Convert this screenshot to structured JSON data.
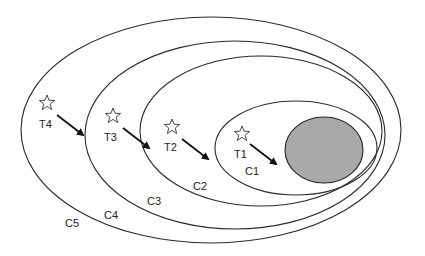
{
  "diagram": {
    "type": "nested-ellipses",
    "core": {
      "name": "core",
      "color": "#a9a9a9",
      "cx": 324,
      "cy": 150,
      "rx": 39,
      "ry": 33
    },
    "rings": [
      {
        "id": "ring-1",
        "cx": 296,
        "cy": 148,
        "rx": 81,
        "ry": 47
      },
      {
        "id": "ring-2",
        "cx": 261,
        "cy": 131,
        "rx": 121,
        "ry": 75
      },
      {
        "id": "ring-3",
        "cx": 235,
        "cy": 135,
        "rx": 150,
        "ry": 94
      },
      {
        "id": "ring-4",
        "cx": 211,
        "cy": 130,
        "rx": 190,
        "ry": 113
      }
    ],
    "markers": [
      {
        "label": "T1",
        "star_x": 242,
        "star_y": 134,
        "label_x": 234,
        "label_y": 158,
        "arrow": [
          250,
          144,
          276,
          164
        ]
      },
      {
        "label": "T2",
        "star_x": 172,
        "star_y": 127,
        "label_x": 164,
        "label_y": 151,
        "arrow": [
          182,
          139,
          208,
          159
        ]
      },
      {
        "label": "T3",
        "star_x": 113,
        "star_y": 116,
        "label_x": 104,
        "label_y": 141,
        "arrow": [
          123,
          128,
          149,
          148
        ]
      },
      {
        "label": "T4",
        "star_x": 47,
        "star_y": 103,
        "label_x": 39,
        "label_y": 128,
        "arrow": [
          57,
          115,
          83,
          135
        ]
      }
    ],
    "class_labels": [
      {
        "text": "C1",
        "x": 245,
        "y": 175
      },
      {
        "text": "C2",
        "x": 193,
        "y": 190
      },
      {
        "text": "C3",
        "x": 147,
        "y": 205
      },
      {
        "text": "C4",
        "x": 104,
        "y": 219
      },
      {
        "text": "C5",
        "x": 65,
        "y": 227
      }
    ]
  }
}
